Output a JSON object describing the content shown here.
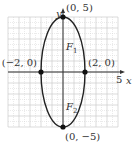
{
  "diagram": {
    "type": "ellipse-graph",
    "equation_params": {
      "a": 2,
      "b": 5,
      "center": [
        0,
        0
      ]
    },
    "grid": {
      "xmin": -5,
      "xmax": 5,
      "ymin": -5,
      "ymax": 5,
      "minor_step": 0.5
    },
    "axes": {
      "x_label": "x",
      "y_label": "y",
      "x_tick_label": "5"
    },
    "points": [
      {
        "name": "top-vertex",
        "x": 0,
        "y": 5,
        "label": "(0, 5)"
      },
      {
        "name": "bottom-vertex",
        "x": 0,
        "y": -5,
        "label": "(0, −5)"
      },
      {
        "name": "left-vertex",
        "x": -2,
        "y": 0,
        "label": "(−2, 0)"
      },
      {
        "name": "right-vertex",
        "x": 2,
        "y": 0,
        "label": "(2, 0)"
      }
    ],
    "foci": [
      {
        "name": "F1",
        "label_main": "F",
        "label_sub": "1",
        "x": 0,
        "y": 4.58
      },
      {
        "name": "F2",
        "label_main": "F",
        "label_sub": "2",
        "x": 0,
        "y": -4.58
      }
    ],
    "colors": {
      "curve": "#222222",
      "axis": "#333333",
      "grid": "#cccccc",
      "point": "#111111"
    }
  }
}
